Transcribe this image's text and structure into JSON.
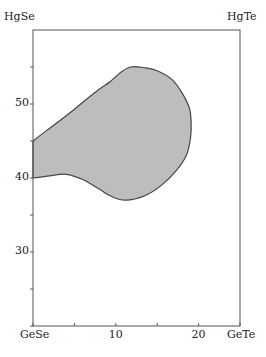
{
  "chart_data": {
    "type": "area",
    "title": "",
    "corner_labels": {
      "top_left": "HgSe",
      "top_right": "HgTe",
      "bottom_left": "GeSe",
      "bottom_right": "GeTe"
    },
    "xlabel": "",
    "ylabel": "",
    "xlim": [
      0,
      25
    ],
    "ylim": [
      20,
      60
    ],
    "x_ticks": [
      0,
      5,
      10,
      15,
      20,
      25
    ],
    "x_tick_labels": [
      "GeSe",
      "",
      "10",
      "",
      "20",
      "GeTe"
    ],
    "y_ticks": [
      20,
      25,
      30,
      35,
      40,
      45,
      50,
      55
    ],
    "y_tick_labels": [
      "",
      "",
      "30",
      "",
      "40",
      "",
      "50",
      ""
    ],
    "grid": false,
    "region": {
      "name": "shaded phase region",
      "fill": "#bdbdbd",
      "stroke": "#444444",
      "boundary": [
        [
          0,
          45
        ],
        [
          1.5,
          46.3
        ],
        [
          3.3,
          47.8
        ],
        [
          5,
          49.3
        ],
        [
          6.3,
          50.5
        ],
        [
          8,
          52
        ],
        [
          9.3,
          53
        ],
        [
          10.5,
          54.2
        ],
        [
          11.8,
          55
        ],
        [
          13.5,
          54.9
        ],
        [
          15,
          54.5
        ],
        [
          16.8,
          53.3
        ],
        [
          18,
          51.5
        ],
        [
          18.9,
          49.4
        ],
        [
          19.1,
          47.3
        ],
        [
          19,
          45.2
        ],
        [
          18.5,
          43
        ],
        [
          17.3,
          41
        ],
        [
          15.5,
          39
        ],
        [
          13.5,
          37.6
        ],
        [
          11.2,
          37
        ],
        [
          9.5,
          37.5
        ],
        [
          8,
          38.5
        ],
        [
          6,
          39.8
        ],
        [
          4,
          40.5
        ],
        [
          2,
          40.3
        ],
        [
          0,
          40
        ]
      ]
    }
  }
}
